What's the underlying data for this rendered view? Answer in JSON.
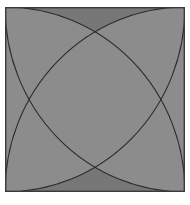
{
  "figure": {
    "description": "A square divided by four circular arcs, each centered on a corner of the square with radius equal to the side length, producing a four-petal rosette with alternating light, medium and dark gray regions.",
    "canvas": {
      "x": 5,
      "y": 7,
      "width": 180,
      "height": 185,
      "page_width": 190,
      "page_height": 205,
      "background": "#ffffff"
    },
    "geometry": {
      "square_side_x": 180,
      "square_side_y": 185,
      "arc_centers": [
        {
          "name": "top-left-center",
          "x": 0,
          "y": 0
        },
        {
          "name": "top-right-center",
          "x": 180,
          "y": 0
        },
        {
          "name": "bottom-left-center",
          "x": 0,
          "y": 185
        },
        {
          "name": "bottom-right-center",
          "x": 180,
          "y": 185
        }
      ],
      "arc_radius_x": 180,
      "arc_radius_y": 185,
      "intersection_points": [
        {
          "name": "top-node",
          "x": 90,
          "y": 26
        },
        {
          "name": "left-node",
          "x": 22,
          "y": 92.5
        },
        {
          "name": "right-node",
          "x": 158,
          "y": 92.5
        },
        {
          "name": "bottom-node",
          "x": 90,
          "y": 159
        }
      ]
    },
    "palette": {
      "light": "#b6b6b6",
      "medium": "#8c8c8c",
      "medium_dark": "#777777",
      "dark": "#4c4c4c",
      "outline": "#2b2b2b",
      "frame": "#3a3a3a",
      "background": "#ffffff"
    },
    "regions": [
      {
        "name": "top-left-petal",
        "fill_role": "light",
        "fill": "#b6b6b6"
      },
      {
        "name": "bottom-right-petal",
        "fill_role": "light",
        "fill": "#b6b6b6"
      },
      {
        "name": "top-right-petal",
        "fill_role": "dark",
        "fill": "#4c4c4c"
      },
      {
        "name": "bottom-left-petal",
        "fill_role": "dark",
        "fill": "#4c4c4c"
      },
      {
        "name": "center-lens",
        "fill_role": "medium",
        "fill": "#8c8c8c"
      },
      {
        "name": "top-crescent",
        "fill_role": "medium_dark",
        "fill": "#777777"
      },
      {
        "name": "bottom-crescent",
        "fill_role": "medium_dark",
        "fill": "#777777"
      },
      {
        "name": "left-crescent",
        "fill_role": "medium",
        "fill": "#8c8c8c"
      },
      {
        "name": "right-crescent",
        "fill_role": "medium",
        "fill": "#8c8c8c"
      }
    ],
    "outline": {
      "stroke": "#2b2b2b",
      "stroke_width": 1.1
    },
    "frame": {
      "stroke": "#3a3a3a",
      "stroke_width": 1.4
    }
  }
}
